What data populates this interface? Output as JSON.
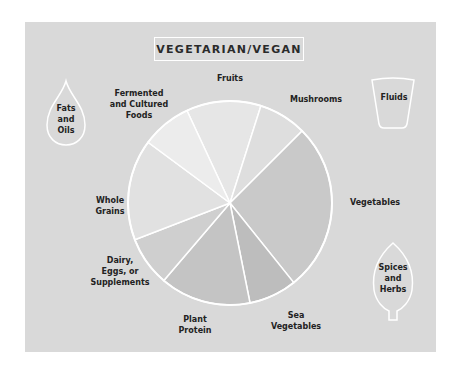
{
  "title": "VEGETARIAN/VEGAN",
  "colors": {
    "page_background": "#ffffff",
    "panel_background": "#d9d9d9",
    "outline": "#ffffff",
    "text": "#222222"
  },
  "side_items": {
    "fats_and_oils": "Fats\nand\nOils",
    "fluids": "Fluids",
    "spices_and_herbs": "Spices\nand\nHerbs"
  },
  "labels": {
    "fermented": "Fermented\nand Cultured\nFoods",
    "fruits": "Fruits",
    "mushrooms": "Mushrooms",
    "vegetables": "Vegetables",
    "sea_vegetables": "Sea\nVegetables",
    "plant_protein": "Plant\nProtein",
    "dairy": "Dairy,\nEggs, or\nSupplements",
    "whole_grains": "Whole\nGrains"
  },
  "chart_data": {
    "type": "pie",
    "title": "VEGETARIAN/VEGAN",
    "categories": [
      "Fruits",
      "Mushrooms",
      "Vegetables",
      "Sea Vegetables",
      "Plant Protein",
      "Dairy, Eggs, or Supplements",
      "Whole Grains",
      "Fermented and Cultured Foods"
    ],
    "values": [
      11.7,
      7.5,
      26.4,
      7.5,
      14.2,
      7.8,
      15.8,
      7.8
    ],
    "unit": "percent (estimated from slice angles)",
    "start_angle_deg_clockwise_from_top": -25,
    "slice_colors": [
      "#e6e6e6",
      "#dedede",
      "#c9c9c9",
      "#bdbdbd",
      "#c4c4c4",
      "#cfcfcf",
      "#e1e1e1",
      "#ececec"
    ],
    "extra_items_outside_pie": [
      "Fats and Oils",
      "Fluids",
      "Spices and Herbs"
    ],
    "legend": "none (direct labels)"
  }
}
